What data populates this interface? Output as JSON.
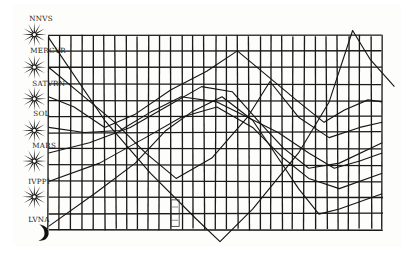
{
  "chart_data": {
    "type": "line",
    "xlabel": "",
    "ylabel": "",
    "grid": true,
    "grid_columns": 30,
    "grid_rows": 12,
    "legend_position": "left",
    "row_labels": [
      "NNVS",
      "MERCVR",
      "SATVRN",
      "SOL",
      "MARS",
      "IVPPI",
      "LVNA"
    ],
    "annotations": [
      "small inscribed box near bottom center"
    ],
    "series": [
      {
        "name": "VENUS",
        "points": [
          [
            45,
            37
          ],
          [
            100,
            118
          ],
          [
            145,
            170
          ],
          [
            190,
            215
          ],
          [
            213,
            237
          ],
          [
            245,
            205
          ],
          [
            290,
            150
          ],
          [
            320,
            100
          ],
          [
            343,
            30
          ],
          [
            360,
            58
          ],
          [
            384,
            85
          ]
        ]
      },
      {
        "name": "MERCVRIVS",
        "points": [
          [
            45,
            66
          ],
          [
            80,
            95
          ],
          [
            110,
            120
          ],
          [
            140,
            150
          ],
          [
            170,
            175
          ],
          [
            205,
            155
          ],
          [
            240,
            115
          ],
          [
            262,
            80
          ],
          [
            290,
            115
          ],
          [
            320,
            135
          ],
          [
            350,
            125
          ],
          [
            372,
            120
          ]
        ]
      },
      {
        "name": "SATVRNVS",
        "points": [
          [
            45,
            95
          ],
          [
            70,
            105
          ],
          [
            100,
            125
          ],
          [
            130,
            112
          ],
          [
            165,
            88
          ],
          [
            200,
            70
          ],
          [
            230,
            50
          ],
          [
            260,
            75
          ],
          [
            290,
            100
          ],
          [
            315,
            120
          ],
          [
            335,
            108
          ],
          [
            358,
            98
          ],
          [
            372,
            100
          ]
        ]
      },
      {
        "name": "SOL",
        "points": [
          [
            45,
            125
          ],
          [
            80,
            130
          ],
          [
            115,
            128
          ],
          [
            145,
            110
          ],
          [
            175,
            95
          ],
          [
            210,
            100
          ],
          [
            240,
            115
          ],
          [
            270,
            130
          ],
          [
            300,
            150
          ],
          [
            325,
            165
          ],
          [
            350,
            158
          ],
          [
            372,
            150
          ]
        ]
      },
      {
        "name": "MARS",
        "points": [
          [
            45,
            150
          ],
          [
            85,
            140
          ],
          [
            125,
            125
          ],
          [
            160,
            105
          ],
          [
            195,
            85
          ],
          [
            225,
            90
          ],
          [
            250,
            118
          ],
          [
            275,
            145
          ],
          [
            300,
            165
          ],
          [
            330,
            160
          ],
          [
            372,
            140
          ]
        ]
      },
      {
        "name": "IVPPITER",
        "points": [
          [
            45,
            178
          ],
          [
            95,
            160
          ],
          [
            140,
            135
          ],
          [
            175,
            115
          ],
          [
            210,
            105
          ],
          [
            245,
            125
          ],
          [
            275,
            155
          ],
          [
            300,
            175
          ],
          [
            330,
            185
          ],
          [
            372,
            170
          ]
        ]
      },
      {
        "name": "LVNA",
        "points": [
          [
            45,
            222
          ],
          [
            90,
            190
          ],
          [
            130,
            160
          ],
          [
            160,
            128
          ],
          [
            185,
            110
          ],
          [
            215,
            95
          ],
          [
            245,
            118
          ],
          [
            270,
            155
          ],
          [
            290,
            185
          ],
          [
            310,
            210
          ],
          [
            330,
            205
          ],
          [
            372,
            190
          ]
        ]
      }
    ],
    "xlim": [
      45,
      372
    ],
    "ylim": [
      35,
      225
    ]
  },
  "labels": {
    "row_0": "NNVS",
    "row_1": "MERCVR",
    "row_2": "SATVRN",
    "row_3": "SOL",
    "row_4": "MARS",
    "row_5": "IVPPI",
    "row_6": "LVNA"
  },
  "icons": [
    "star-icon",
    "star-icon",
    "star-icon",
    "star-icon",
    "star-icon",
    "star-icon",
    "star-icon",
    "crescent-moon-icon"
  ]
}
